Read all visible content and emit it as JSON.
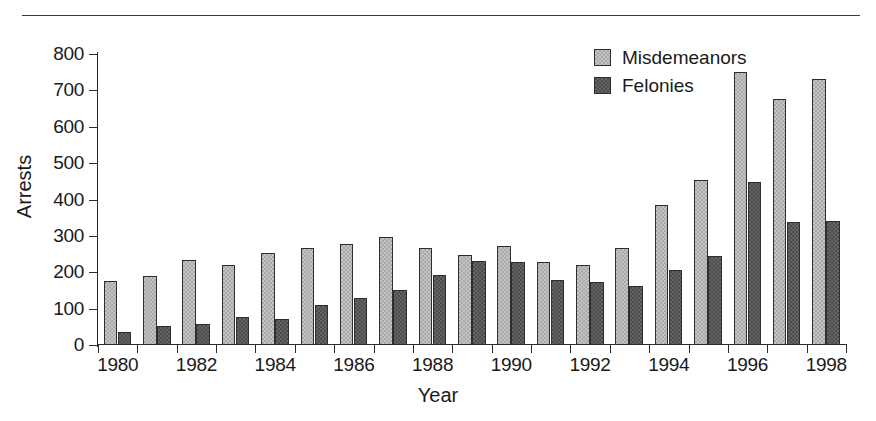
{
  "figure": {
    "background_color": "#ffffff",
    "rule_color": "#3a3a3a",
    "axis_color": "#2b2b2b"
  },
  "chart_data": {
    "type": "bar",
    "title": "",
    "xlabel": "Year",
    "ylabel": "Arrests",
    "ylim": [
      0,
      800
    ],
    "yticks": [
      0,
      100,
      200,
      300,
      400,
      500,
      600,
      700,
      800
    ],
    "xtick_labels": [
      "1980",
      "1982",
      "1984",
      "1986",
      "1988",
      "1990",
      "1992",
      "1994",
      "1996",
      "1998"
    ],
    "grid": false,
    "legend_position": "top-right",
    "categories": [
      "1980",
      "1981",
      "1982",
      "1983",
      "1984",
      "1985",
      "1986",
      "1987",
      "1988",
      "1989",
      "1990",
      "1991",
      "1992",
      "1993",
      "1994",
      "1995",
      "1996",
      "1997",
      "1998"
    ],
    "series": [
      {
        "name": "Misdemeanors",
        "color": "#a9a9a9",
        "values": [
          176,
          190,
          233,
          219,
          254,
          267,
          278,
          298,
          268,
          247,
          271,
          227,
          219,
          266,
          384,
          455,
          750,
          676,
          731
        ]
      },
      {
        "name": "Felonies",
        "color": "#4d4d4d",
        "values": [
          36,
          51,
          59,
          78,
          71,
          111,
          130,
          151,
          192,
          230,
          228,
          180,
          174,
          162,
          207,
          246,
          448,
          338,
          342
        ]
      }
    ]
  },
  "legend": {
    "entries": [
      {
        "label": "Misdemeanors"
      },
      {
        "label": "Felonies"
      }
    ]
  }
}
